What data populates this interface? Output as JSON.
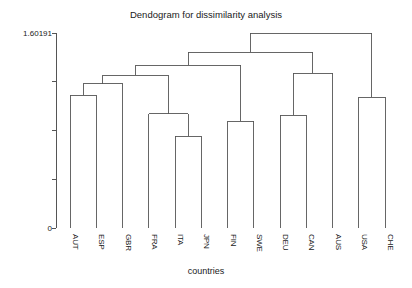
{
  "chart_data": {
    "type": "dendrogram",
    "title": "Dendogram for dissimilarity analysis",
    "xlabel": "countries",
    "ylabel": "",
    "ylim": [
      0,
      1.60191
    ],
    "y_axis_top_label": "1.60191",
    "y_axis_bottom_label": "0",
    "y_tick_values": [
      0,
      0.4,
      0.8,
      1.2,
      1.60191
    ],
    "y_tick_labels": [
      "0",
      "",
      "",
      "",
      "1.60191"
    ],
    "grid": false,
    "legend": "none",
    "leaves": [
      "AUT",
      "ESP",
      "GBR",
      "FRA",
      "ITA",
      "JPN",
      "FIN",
      "SWE",
      "DEU",
      "CAN",
      "AUS",
      "USA",
      "CHE"
    ],
    "merges": [
      {
        "id": "m1",
        "label": "AUT-ESP",
        "left": "AUT",
        "right": "ESP",
        "height": 1.09
      },
      {
        "id": "m2",
        "label": "AUT-ESP-GBR",
        "left": "m1",
        "right": "GBR",
        "height": 1.185
      },
      {
        "id": "m3",
        "label": "ITA-JPN",
        "left": "ITA",
        "right": "JPN",
        "height": 0.755
      },
      {
        "id": "m4",
        "label": "FRA-ITA-JPN",
        "left": "FRA",
        "right": "m3",
        "height": 0.94
      },
      {
        "id": "m5",
        "label": "europe-west",
        "left": "m2",
        "right": "m4",
        "height": 1.255
      },
      {
        "id": "m6",
        "label": "FIN-SWE",
        "left": "FIN",
        "right": "SWE",
        "height": 0.875
      },
      {
        "id": "m7",
        "label": "europe-nordic",
        "left": "m5",
        "right": "m6",
        "height": 1.335
      },
      {
        "id": "m8",
        "label": "DEU-CAN",
        "left": "DEU",
        "right": "CAN",
        "height": 0.925
      },
      {
        "id": "m9",
        "label": "DEU-CAN-AUS",
        "left": "m8",
        "right": "AUS",
        "height": 1.27
      },
      {
        "id": "m10",
        "label": "old-new-world",
        "left": "m7",
        "right": "m9",
        "height": 1.445
      },
      {
        "id": "m11",
        "label": "USA-CHE",
        "left": "USA",
        "right": "CHE",
        "height": 1.075
      },
      {
        "id": "m12",
        "label": "root",
        "left": "m10",
        "right": "m11",
        "height": 1.60191
      }
    ]
  }
}
